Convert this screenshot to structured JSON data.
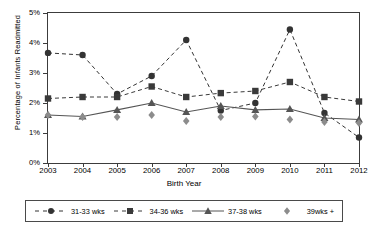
{
  "chart_data": {
    "type": "line",
    "title": "",
    "xlabel": "Birth Year",
    "ylabel": "Percentage of Infants Readmitted",
    "categories": [
      "2003",
      "2004",
      "2005",
      "2006",
      "2007",
      "2008",
      "2009",
      "2010",
      "2011",
      "2012"
    ],
    "x_tick_labels": [
      "2003",
      "2004",
      "2005",
      "2006",
      "2007",
      "2008",
      "2009",
      "2010",
      "2011",
      "2012"
    ],
    "y_tick_labels": [
      "0%",
      "1%",
      "2%",
      "3%",
      "4%",
      "5%"
    ],
    "y_tick_values": [
      0,
      1,
      2,
      3,
      4,
      5
    ],
    "ylim": [
      0,
      5
    ],
    "xlim": [
      "2003",
      "2012"
    ],
    "grid": false,
    "legend_position": "bottom",
    "series": [
      {
        "name": "31-33 wks",
        "marker": "circle",
        "line_style": "dashed",
        "color": "#333333",
        "values": [
          3.67,
          3.6,
          2.3,
          2.9,
          4.1,
          1.75,
          2.0,
          4.45,
          1.67,
          0.85
        ]
      },
      {
        "name": "34-36 wks",
        "marker": "square",
        "line_style": "dashed",
        "color": "#3a3a3a",
        "values": [
          2.15,
          2.2,
          2.2,
          2.55,
          2.2,
          2.33,
          2.4,
          2.7,
          2.2,
          2.05
        ]
      },
      {
        "name": "37-38 wks",
        "marker": "triangle",
        "line_style": "solid",
        "color": "#555555",
        "values": [
          1.6,
          1.55,
          1.77,
          2.0,
          1.7,
          1.9,
          1.77,
          1.8,
          1.5,
          1.45
        ]
      },
      {
        "name": "39wks +",
        "marker": "diamond",
        "line_style": "none",
        "color": "#8c8c8c",
        "values": [
          1.6,
          1.53,
          1.53,
          1.6,
          1.4,
          1.53,
          1.55,
          1.45,
          1.37,
          1.33
        ]
      }
    ]
  },
  "axes": {
    "y_title": "Percentage of Infants Readmitted",
    "x_title": "Birth Year"
  },
  "legend": {
    "items": [
      {
        "label": "31-33 wks"
      },
      {
        "label": "34-36 wks"
      },
      {
        "label": "37-38 wks"
      },
      {
        "label": "39wks +"
      }
    ]
  }
}
